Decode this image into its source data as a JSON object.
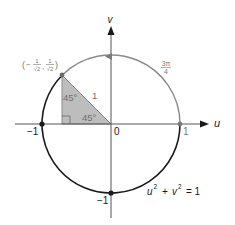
{
  "diagram": {
    "colors": {
      "black": "#1a1a1a",
      "gray_arc": "#8a8a8a",
      "triangle_fill": "#bdbdbd",
      "triangle_text": "#6f6f6f",
      "gray_text": "#7a7a7a"
    },
    "axes": {
      "u_label": "u",
      "v_label": "v",
      "origin_label": "0"
    },
    "ticks": {
      "u_pos": "1",
      "u_neg": "−1",
      "v_neg": "−1"
    },
    "point": {
      "label_open": "(",
      "label_minus": "−",
      "label_num": "1",
      "label_den": "√2",
      "label_comma": ",",
      "label_close": ")"
    },
    "arc_label": {
      "num": "3π",
      "den": "4"
    },
    "triangle": {
      "angle_top": "45°",
      "angle_bottom": "45°",
      "hypotenuse": "1"
    },
    "equation": {
      "u": "u",
      "u_exp": "2",
      "plus": "+",
      "v": "v",
      "v_exp": "2",
      "equals": "= 1"
    }
  }
}
